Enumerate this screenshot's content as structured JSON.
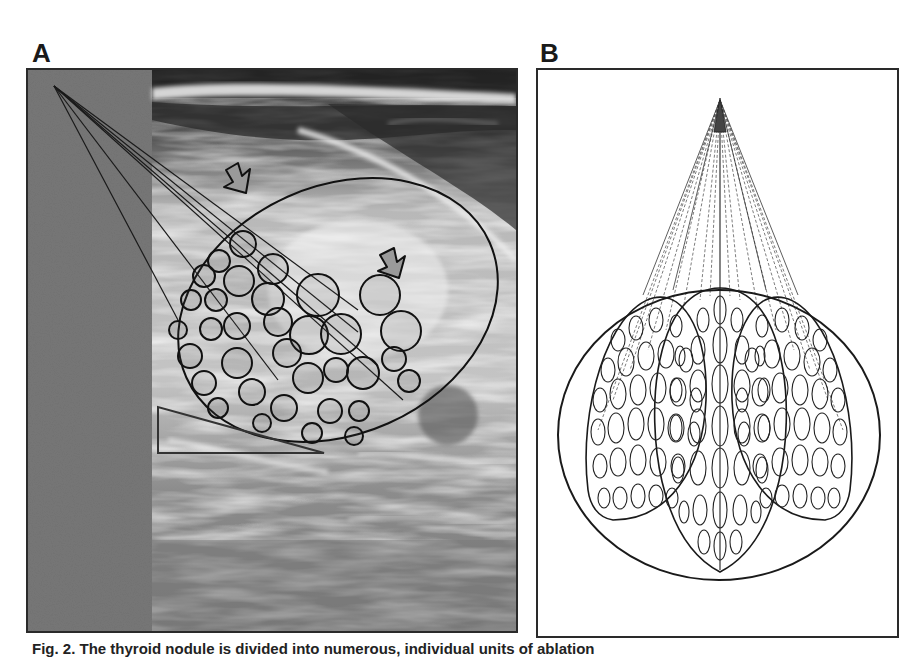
{
  "figure": {
    "panels": [
      {
        "id": "A",
        "label": "A",
        "description": "Ultrasound image of thyroid nodule with overlaid ellipse outline, ablation circles, fan lines from probe point and two arrows"
      },
      {
        "id": "B",
        "label": "B",
        "description": "Schematic of moving-shot ablation: needle trajectories fanning from insertion point into three overlapping lobes of ellipsoid ablation units within a circular nodule outline"
      }
    ],
    "caption": "Fig. 2. The thyroid nodule is divided into numerous, individual units of ablation"
  },
  "colors": {
    "line": "#1a1a1a",
    "panel_border": "#2a2a2a",
    "gray_strip": "#7a7a7a",
    "background": "#ffffff"
  },
  "annotations": {
    "arrows": [
      {
        "name": "arrow-upper-left",
        "x": 236,
        "y": 178
      },
      {
        "name": "arrow-center",
        "x": 388,
        "y": 261
      }
    ]
  }
}
